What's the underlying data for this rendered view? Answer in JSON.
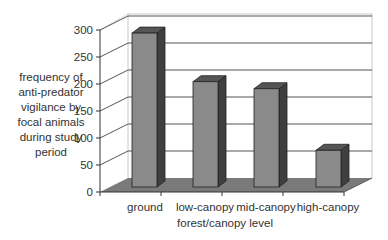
{
  "chart_data": {
    "type": "bar",
    "style": "3d-column",
    "title": "",
    "xlabel": "forest/canopy level",
    "ylabel": "frequency of anti-predator vigilance by focal animals during study period",
    "ylabel_lines": [
      "frequency of",
      "anti-predator",
      "vigilance by",
      "focal animals",
      "during study",
      "period"
    ],
    "categories": [
      "ground",
      "low-canopy",
      "mid-canopy",
      "high-canopy"
    ],
    "values": [
      285,
      195,
      182,
      68
    ],
    "ylim": [
      0,
      300
    ],
    "yticks": [
      "0",
      "50",
      "100",
      "150",
      "200",
      "250",
      "300"
    ],
    "grid": true,
    "legend": null,
    "colors": {
      "bar_front": "#8a8a8a",
      "bar_side": "#3f3f3f",
      "bar_top": "#555555",
      "floor": "#7a7a7a",
      "gridline": "#555555",
      "wall_edge": "#c8c8c8"
    }
  }
}
